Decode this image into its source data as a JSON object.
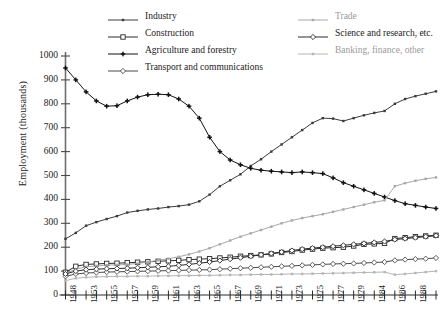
{
  "chart_data": {
    "type": "line",
    "title": "",
    "xlabel": "",
    "ylabel": "Employment  (thousands)",
    "ylim": [
      0,
      1000
    ],
    "ytick_labels": [
      "0",
      "100",
      "200",
      "300",
      "400",
      "500",
      "600",
      "700",
      "800",
      "900",
      "1000"
    ],
    "ytick_values": [
      0,
      100,
      200,
      300,
      400,
      500,
      600,
      700,
      800,
      900,
      1000
    ],
    "grid": false,
    "legend_position": "top",
    "x": [
      1948,
      1949,
      1950,
      1951,
      1952,
      1953,
      1954,
      1955,
      1956,
      1957,
      1958,
      1959,
      1960,
      1961,
      1962,
      1963,
      1964,
      1965,
      1966,
      1967,
      1968,
      1969,
      1970,
      1971,
      1972,
      1973,
      1974,
      1975,
      1976,
      1977,
      1978,
      1979,
      1984,
      1985,
      1986,
      1987,
      1988
    ],
    "xtick_labels": [
      "1948",
      "",
      "1953",
      "",
      "1955",
      "",
      "1957",
      "",
      "1959",
      "",
      "1961",
      "",
      "1963",
      "",
      "1965",
      "",
      "1967",
      "",
      "1969",
      "",
      "1971",
      "",
      "1973",
      "",
      "1975",
      "",
      "1977",
      "",
      "1979",
      "",
      "1984",
      "",
      "1986",
      "",
      "1988"
    ],
    "xtick_labels_shown": [
      "1948",
      "1953",
      "1955",
      "1957",
      "1959",
      "1961",
      "1963",
      "1965",
      "1967",
      "1969",
      "1971",
      "1973",
      "1975",
      "1977",
      "1979",
      "1984",
      "1986",
      "1988"
    ],
    "series": [
      {
        "name": "Industry",
        "color": "#3c3c3c",
        "marker": "dot-small",
        "values": [
          235,
          260,
          290,
          305,
          318,
          330,
          345,
          352,
          358,
          362,
          368,
          372,
          378,
          392,
          420,
          455,
          480,
          505,
          540,
          568,
          600,
          630,
          660,
          690,
          720,
          740,
          738,
          728,
          740,
          752,
          762,
          770,
          800,
          820,
          832,
          842,
          852
        ]
      },
      {
        "name": "Construction",
        "color": "#2a2a2a",
        "marker": "open-square",
        "values": [
          95,
          120,
          128,
          130,
          132,
          133,
          135,
          137,
          139,
          141,
          143,
          145,
          148,
          150,
          152,
          155,
          158,
          162,
          165,
          168,
          172,
          178,
          182,
          188,
          192,
          196,
          198,
          200,
          205,
          212,
          214,
          216,
          236,
          240,
          244,
          247,
          250
        ]
      },
      {
        "name": "Agriculture and forestry",
        "color": "#111111",
        "marker": "plus-filled",
        "values": [
          950,
          900,
          850,
          812,
          790,
          792,
          812,
          828,
          838,
          840,
          838,
          820,
          790,
          740,
          660,
          600,
          565,
          545,
          530,
          522,
          518,
          515,
          512,
          515,
          512,
          508,
          490,
          470,
          455,
          440,
          425,
          410,
          395,
          382,
          375,
          368,
          362
        ]
      },
      {
        "name": "Transport and communications",
        "color": "#4a4a4a",
        "marker": "open-diamond",
        "values": [
          78,
          88,
          92,
          94,
          96,
          97,
          98,
          99,
          100,
          101,
          102,
          103,
          104,
          105,
          106,
          108,
          110,
          112,
          114,
          116,
          118,
          120,
          122,
          124,
          126,
          128,
          130,
          131,
          132,
          134,
          136,
          138,
          145,
          148,
          150,
          152,
          155
        ]
      },
      {
        "name": "Trade",
        "color": "#a8a8a8",
        "marker": "dot-small",
        "values": [
          90,
          108,
          118,
          122,
          125,
          126,
          128,
          132,
          138,
          145,
          152,
          160,
          170,
          182,
          196,
          212,
          228,
          244,
          258,
          272,
          286,
          300,
          312,
          322,
          330,
          338,
          348,
          358,
          368,
          378,
          388,
          396,
          455,
          468,
          478,
          486,
          492
        ]
      },
      {
        "name": "Science and research, etc.",
        "color": "#2a2a2a",
        "marker": "open-diamond",
        "values": [
          88,
          100,
          106,
          108,
          110,
          111,
          112,
          114,
          116,
          118,
          120,
          124,
          128,
          133,
          138,
          144,
          150,
          156,
          162,
          168,
          174,
          180,
          186,
          192,
          196,
          200,
          204,
          208,
          212,
          216,
          220,
          224,
          232,
          236,
          240,
          244,
          248
        ]
      },
      {
        "name": "Banking, finance, other",
        "color": "#b5b5b5",
        "marker": "dot-small",
        "values": [
          60,
          70,
          74,
          76,
          77,
          78,
          78,
          79,
          79,
          80,
          80,
          81,
          81,
          82,
          82,
          83,
          84,
          84,
          85,
          86,
          86,
          87,
          88,
          88,
          89,
          90,
          91,
          92,
          93,
          94,
          95,
          96,
          85,
          88,
          92,
          96,
          100
        ]
      }
    ]
  },
  "legend": {
    "items": [
      {
        "label": "Industry",
        "col": 0,
        "row": 0
      },
      {
        "label": "Construction",
        "col": 0,
        "row": 1
      },
      {
        "label": "Agriculture and forestry",
        "col": 0,
        "row": 2
      },
      {
        "label": "Transport and communications",
        "col": 0,
        "row": 3
      },
      {
        "label": "Trade",
        "col": 1,
        "row": 0
      },
      {
        "label": "Science and research, etc.",
        "col": 1,
        "row": 1
      },
      {
        "label": "Banking, finance, other",
        "col": 1,
        "row": 2
      }
    ]
  },
  "caption": ""
}
